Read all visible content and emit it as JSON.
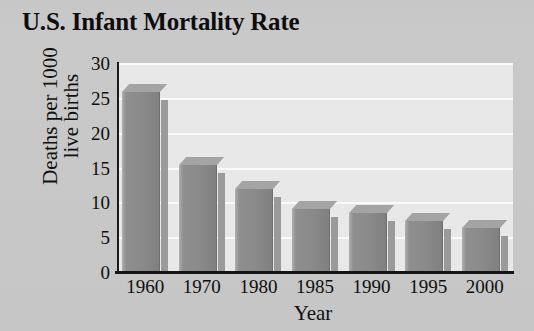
{
  "chart_data": {
    "type": "bar",
    "title": "U.S. Infant Mortality Rate",
    "xlabel": "Year",
    "ylabel": "Deaths per 1000 live births",
    "ylabel_line1": "Deaths per 1000",
    "ylabel_line2": "live births",
    "categories": [
      "1960",
      "1970",
      "1980",
      "1985",
      "1990",
      "1995",
      "2000"
    ],
    "values": [
      26.0,
      15.5,
      12.0,
      9.2,
      8.6,
      7.4,
      6.5
    ],
    "yticks": [
      0,
      5,
      10,
      15,
      20,
      25,
      30
    ],
    "ytick_labels": [
      "0",
      "5",
      "10",
      "15",
      "20",
      "25",
      "30"
    ],
    "ylim": [
      0,
      30
    ],
    "grid": true,
    "grid_axis": "y",
    "legend": null,
    "bar_style": "3d",
    "colors": {
      "background": "#c8c8c8",
      "plot_background": "#e8e8e8",
      "bar_front": "#8a8a8a",
      "bar_top": "#a4a4a4",
      "bar_side": "#9a9a9a",
      "gridline": "#fbfbfb",
      "axis": "#141414",
      "text": "#0f0f0f"
    }
  }
}
